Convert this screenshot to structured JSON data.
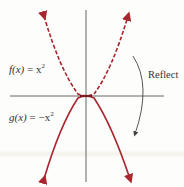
{
  "diagram": {
    "labels": {
      "f_fn": "f(x)",
      "f_eq": " = x",
      "f_exp": "2",
      "g_fn": "g(x)",
      "g_eq": " = −x",
      "g_exp": "2",
      "reflect": "Reflect"
    },
    "colors": {
      "curve": "#a8262e",
      "axis": "#555555",
      "arrow": "#444444"
    },
    "curves": [
      {
        "name": "f(x) = x^2",
        "style": "dashed",
        "opens": "up"
      },
      {
        "name": "g(x) = -x^2",
        "style": "solid",
        "opens": "down"
      }
    ]
  }
}
